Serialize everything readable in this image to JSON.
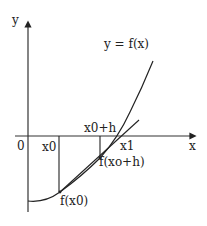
{
  "diagram": {
    "title": "y = f(x)",
    "axes": {
      "x_label": "x",
      "y_label": "y",
      "origin_label": "0"
    },
    "points": {
      "x0": "x0",
      "x0_plus_h": "x0+h",
      "x1": "x1",
      "f_x0": "f(x0)",
      "f_x0_plus_h": "f(xo+h)"
    },
    "colors": {
      "stroke": "#222222",
      "background": "#ffffff"
    }
  }
}
